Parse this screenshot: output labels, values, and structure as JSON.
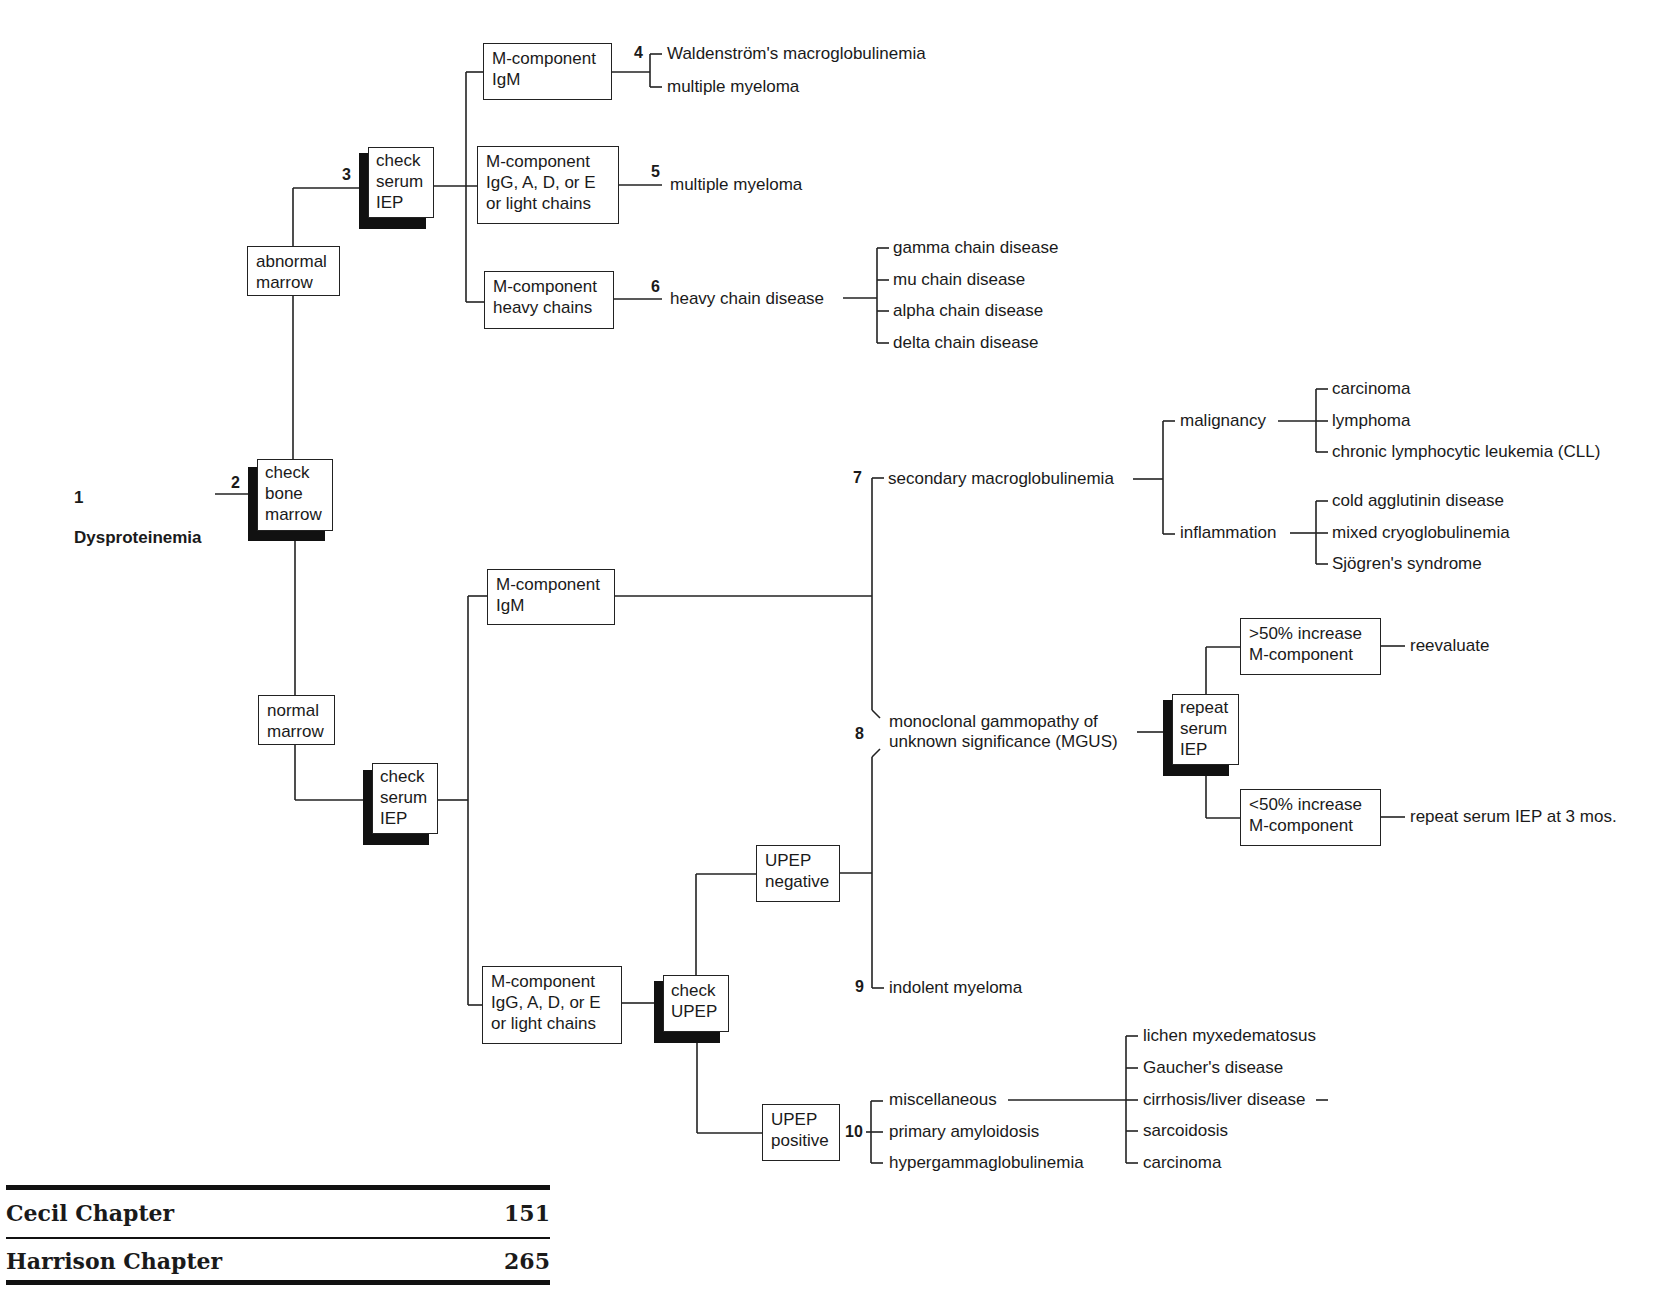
{
  "root": {
    "number": "1",
    "label": "Dysproteinemia"
  },
  "steps": {
    "check_bone_marrow": {
      "number": "2",
      "label": "check\nbone\nmarrow"
    },
    "abnormal_marrow": "abnormal\nmarrow",
    "normal_marrow": "normal\nmarrow",
    "check_serum_iep_top": {
      "number": "3",
      "label": "check\nserum\nIEP"
    },
    "check_serum_iep_bottom": {
      "label": "check\nserum\nIEP"
    },
    "check_upep": {
      "label": "check\nUPEP"
    },
    "repeat_serum_iep": {
      "label": "repeat\nserum\nIEP"
    }
  },
  "top_branch": {
    "igm_box": "M-component\nIgM",
    "igm_number": "4",
    "igm_outcomes": [
      "Waldenström's macroglobulinemia",
      "multiple myeloma"
    ],
    "igg_box": "M-component\nIgG, A, D, or E\nor light chains",
    "igg_number": "5",
    "igg_outcome": "multiple myeloma",
    "heavy_box": "M-component\nheavy chains",
    "heavy_number": "6",
    "heavy_outcome": "heavy chain disease",
    "heavy_subtypes": [
      "gamma chain disease",
      "mu chain disease",
      "alpha chain disease",
      "delta chain disease"
    ]
  },
  "bottom_branch": {
    "igm_box": "M-component\nIgM",
    "igg_box": "M-component\nIgG, A, D, or E\nor light chains",
    "secondary": {
      "number": "7",
      "label": "secondary macroglobulinemia",
      "malignancy": {
        "label": "malignancy",
        "items": [
          "carcinoma",
          "lymphoma",
          "chronic lymphocytic leukemia (CLL)"
        ]
      },
      "inflammation": {
        "label": "inflammation",
        "items": [
          "cold agglutinin disease",
          "mixed cryoglobulinemia",
          "Sjögren's syndrome"
        ]
      }
    },
    "mgus": {
      "number": "8",
      "label": "monoclonal gammopathy of\nunknown significance (MGUS)",
      "gt50_box": ">50% increase\nM-component",
      "gt50_outcome": "reevaluate",
      "lt50_box": "<50% increase\nM-component",
      "lt50_outcome": "repeat serum IEP at 3 mos."
    },
    "upep_negative": "UPEP\nnegative",
    "upep_positive": "UPEP\npositive",
    "indolent": {
      "number": "9",
      "label": "indolent myeloma"
    },
    "upep_pos_number": "10",
    "upep_pos_outcomes": [
      "miscellaneous",
      "primary amyloidosis",
      "hypergammaglobulinemia"
    ],
    "misc_items": [
      "lichen myxedematosus",
      "Gaucher's disease",
      "cirrhosis/liver disease",
      "sarcoidosis",
      "carcinoma"
    ]
  },
  "references": [
    {
      "label": "Cecil Chapter",
      "value": "151"
    },
    {
      "label": "Harrison Chapter",
      "value": "265"
    }
  ]
}
